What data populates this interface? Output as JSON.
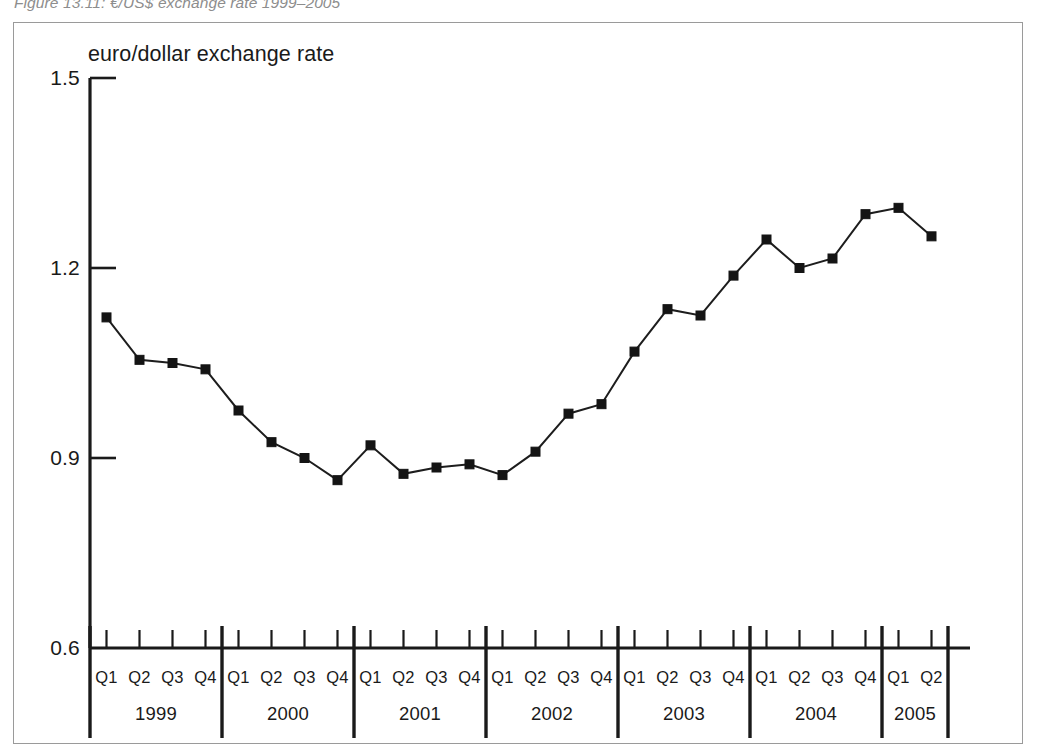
{
  "figure": {
    "caption": "Figure 13.11: €/US$ exchange rate 1999–2005"
  },
  "chart_data": {
    "type": "line",
    "title": "",
    "y_axis_title": "euro/dollar exchange rate",
    "xlabel": "",
    "ylabel": "euro/dollar exchange rate",
    "ylim": [
      0.6,
      1.5
    ],
    "ytick_labels": [
      "1.5",
      "1.2",
      "0.9",
      "0.6"
    ],
    "yticks": [
      1.5,
      1.2,
      0.9,
      0.6
    ],
    "grid": false,
    "legend": false,
    "marker": "square",
    "line_color": "#1d1d1d",
    "marker_color": "#141414",
    "years": [
      "1999",
      "2000",
      "2001",
      "2002",
      "2003",
      "2004",
      "2005"
    ],
    "quarter_labels": [
      "Q1",
      "Q2",
      "Q3",
      "Q4"
    ],
    "categories": [
      "1999 Q1",
      "1999 Q2",
      "1999 Q3",
      "1999 Q4",
      "2000 Q1",
      "2000 Q2",
      "2000 Q3",
      "2000 Q4",
      "2001 Q1",
      "2001 Q2",
      "2001 Q3",
      "2001 Q4",
      "2002 Q1",
      "2002 Q2",
      "2002 Q3",
      "2002 Q4",
      "2003 Q1",
      "2003 Q2",
      "2003 Q3",
      "2003 Q4",
      "2004 Q1",
      "2004 Q2",
      "2004 Q3",
      "2004 Q4",
      "2005 Q1",
      "2005 Q2"
    ],
    "values": [
      1.122,
      1.055,
      1.05,
      1.04,
      0.975,
      0.925,
      0.9,
      0.865,
      0.92,
      0.875,
      0.885,
      0.89,
      0.873,
      0.91,
      0.97,
      0.985,
      1.068,
      1.135,
      1.125,
      1.188,
      1.245,
      1.2,
      1.215,
      1.285,
      1.295,
      1.25
    ]
  }
}
